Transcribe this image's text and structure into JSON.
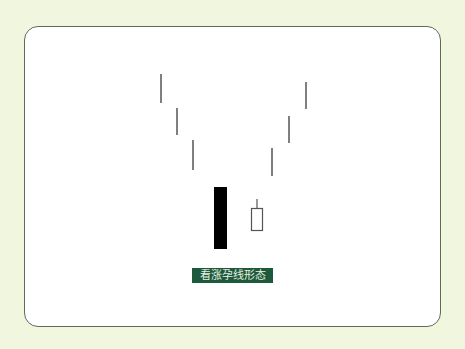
{
  "diagram": {
    "title": "看涨孕线形态",
    "colors": {
      "background": "#f1f7df",
      "frame_border": "#5d6b5a",
      "label_bg": "#1d5a3c",
      "label_text": "#e8efe2",
      "bearish_body": "#000000",
      "line": "#555555"
    },
    "downtrend_lines": [
      {
        "x": 161,
        "y1": 74,
        "y2": 103
      },
      {
        "x": 177,
        "y1": 108,
        "y2": 135
      },
      {
        "x": 193,
        "y1": 140,
        "y2": 170
      }
    ],
    "bearish_candle": {
      "x": 214,
      "y": 187,
      "width": 13,
      "height": 62,
      "fill": "black"
    },
    "bullish_candle": {
      "wick_x": 257,
      "wick_top": 199,
      "body_x": 251,
      "body_y": 208,
      "width": 12,
      "height": 23,
      "fill": "white"
    },
    "uptrend_lines": [
      {
        "x": 272,
        "y1": 148,
        "y2": 176
      },
      {
        "x": 289,
        "y1": 116,
        "y2": 143
      },
      {
        "x": 306,
        "y1": 82,
        "y2": 109
      }
    ]
  }
}
